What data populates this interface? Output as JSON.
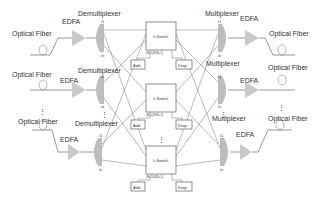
{
  "diagram": {
    "title": "",
    "input_side": {
      "fibers": [
        {
          "label": "Optical Fiber",
          "amp_label": "EDFA",
          "demux_label": "Demultiplexer"
        },
        {
          "label": "Optical Fiber",
          "amp_label": "EDFA",
          "demux_label": "Demultiplexer"
        },
        {
          "label": "Optical Fiber",
          "amp_label": "EDFA",
          "demux_label": "Demultiplexer"
        }
      ]
    },
    "output_side": {
      "fibers": [
        {
          "label": "Optical Fiber",
          "amp_label": "EDFA",
          "mux_label": "Multiplexer"
        },
        {
          "label": "Optical Fiber",
          "amp_label": "EDFA",
          "mux_label": "Multiplexer"
        },
        {
          "label": "Optical Fiber",
          "amp_label": "EDFA",
          "mux_label": "Multiplexer"
        }
      ]
    },
    "switches": [
      {
        "label": "λ-Switch",
        "size_label": "(N+1)X(N+1)",
        "add_label": "Add",
        "drop_label": "Drop"
      },
      {
        "label": "λ-Switch",
        "size_label": "(N+1)X(N+1)",
        "add_label": "Add",
        "drop_label": "Drop"
      },
      {
        "label": "λ-Switch",
        "size_label": "(N+1)X(N+1)",
        "add_label": "Add",
        "drop_label": "Drop"
      }
    ],
    "wavelength_labels": {
      "first": "λ1",
      "last": "λn"
    },
    "ellipsis": "⋮",
    "colors": {
      "amplifier": "#c9c9c9",
      "mux": "#bdbdbd",
      "line": "#555555",
      "text": "#333333"
    }
  }
}
